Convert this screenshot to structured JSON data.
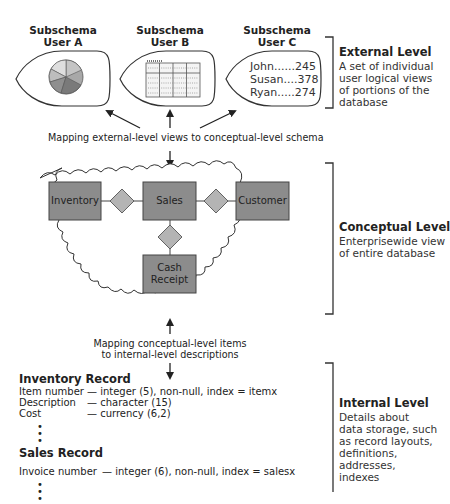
{
  "external": {
    "subschemas": [
      {
        "title_line1": "Subschema",
        "title_line2": "User A",
        "view": "pie-chart"
      },
      {
        "title_line1": "Subschema",
        "title_line2": "User B",
        "view": "table-grid"
      },
      {
        "title_line1": "Subschema",
        "title_line2": "User C",
        "view": "list",
        "rows": [
          "John......245",
          "Susan....378",
          "Ryan.....274"
        ]
      }
    ],
    "level_title": "External Level",
    "level_desc_lines": [
      "A set of individual",
      "user logical views",
      "of portions of the",
      "database"
    ],
    "mapping_text": "Mapping external-level views to conceptual-level schema"
  },
  "conceptual": {
    "entities": {
      "inventory": "Inventory",
      "sales": "Sales",
      "customer": "Customer",
      "cash_receipt_line1": "Cash",
      "cash_receipt_line2": "Receipt"
    },
    "level_title": "Conceptual Level",
    "level_desc_lines": [
      "Enterprisewide view",
      "of entire database"
    ],
    "mapping_text_line1": "Mapping conceptual-level items",
    "mapping_text_line2": "to internal-level descriptions"
  },
  "internal": {
    "records": [
      {
        "title": "Inventory Record",
        "fields": [
          {
            "name": "Item number",
            "spec": "— integer (5), non-null, index = itemx"
          },
          {
            "name": "Description",
            "spec": "— character (15)"
          },
          {
            "name": "Cost",
            "spec": "— currency (6,2)"
          }
        ]
      },
      {
        "title": "Sales Record",
        "fields": [
          {
            "name": "Invoice number",
            "spec": "— integer (6), non-null, index = salesx"
          }
        ]
      }
    ],
    "ellipsis": "•",
    "level_title": "Internal Level",
    "level_desc_lines": [
      "Details about",
      "data storage, such",
      "as record layouts,",
      "definitions, addresses,",
      "indexes"
    ]
  },
  "colors": {
    "entity_fill": "#8c8c8c",
    "diamond_fill": "#b4b4b4",
    "line": "#333333"
  }
}
